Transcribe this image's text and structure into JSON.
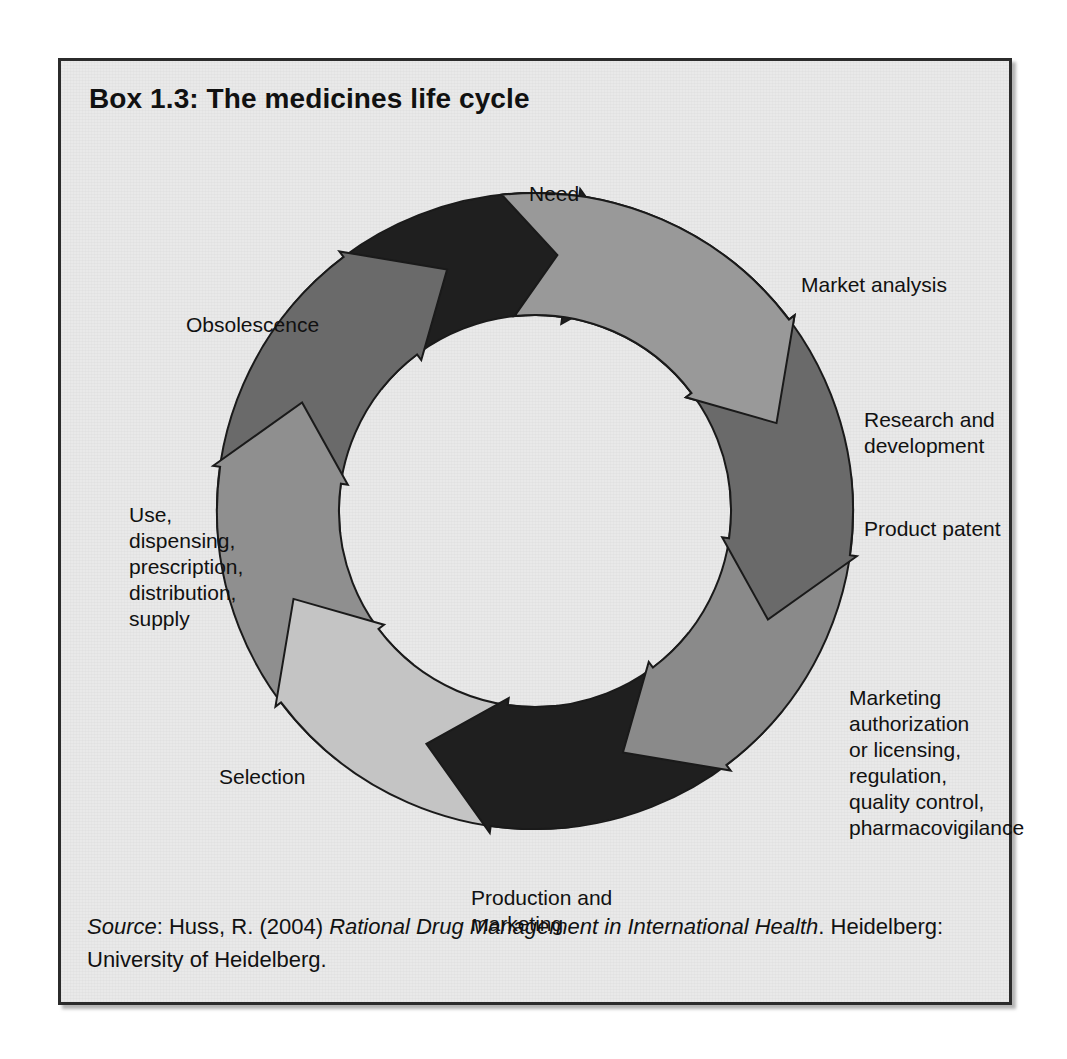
{
  "box": {
    "title": "Box 1.3: The medicines life cycle",
    "background_color": "#e9e9e9",
    "border_color": "#2b2b2b"
  },
  "diagram": {
    "type": "cycle",
    "name": "medicines-life-cycle",
    "center": {
      "x": 474,
      "y": 392
    },
    "outer_radius": 318,
    "inner_radius": 196,
    "direction": "clockwise",
    "outline_color": "#1a1a1a",
    "segment_count": 8,
    "segments": [
      {
        "id": "need",
        "label": "Need",
        "color": "#999999",
        "start_angle": -96,
        "end_angle": -20,
        "label_x": 468,
        "label_y": 62,
        "label_align": "lbl-mid"
      },
      {
        "id": "market-analysis",
        "label": "Market analysis",
        "color": "#6a6a6a",
        "start_angle": -51,
        "end_angle": 25,
        "label_x": 740,
        "label_y": 153,
        "label_align": "lbl-right"
      },
      {
        "id": "research-and-development",
        "label": "Research and\ndevelopment",
        "color": "#8a8a8a",
        "start_angle": -6,
        "end_angle": 70,
        "label_x": 803,
        "label_y": 288,
        "label_align": "lbl-right"
      },
      {
        "id": "product-patent",
        "label": "Product patent",
        "color": "#1f1f1f",
        "start_angle": 39,
        "end_angle": 115,
        "label_x": 803,
        "label_y": 397,
        "label_align": "lbl-right"
      },
      {
        "id": "marketing-authorization",
        "label": "Marketing\nauthorization\nor licensing,\nregulation,\nquality control,\npharmacovigilance",
        "color": "#c4c4c4",
        "start_angle": 84,
        "end_angle": 160,
        "label_x": 788,
        "label_y": 566,
        "label_align": "lbl-right"
      },
      {
        "id": "production-and-marketing",
        "label": "Production and\nmarketing",
        "color": "#8f8f8f",
        "start_angle": 129,
        "end_angle": 205,
        "label_x": 410,
        "label_y": 766,
        "label_align": "lbl-mid"
      },
      {
        "id": "selection",
        "label": "Selection",
        "color": "#6a6a6a",
        "start_angle": 174,
        "end_angle": 250,
        "label_x": 158,
        "label_y": 645,
        "label_align": "lbl-left"
      },
      {
        "id": "use-dispensing",
        "label": "Use,\ndispensing,\nprescription,\ndistribution,\nsupply",
        "color": "#1f1f1f",
        "start_angle": 219,
        "end_angle": 295,
        "label_x": 68,
        "label_y": 383,
        "label_align": "lbl-left"
      },
      {
        "id": "obsolescence",
        "label": "Obsolescence",
        "color": "#bdbdbd",
        "start_angle": 264,
        "end_angle": 340,
        "label_x": 125,
        "label_y": 193,
        "label_align": "lbl-left"
      }
    ]
  },
  "source": {
    "prefix": "Source",
    "colon": ": ",
    "author": "Huss, R. (2004) ",
    "work": "Rational Drug Management in International Health",
    "publisher": ". Heidelberg: University of Heidelberg."
  }
}
